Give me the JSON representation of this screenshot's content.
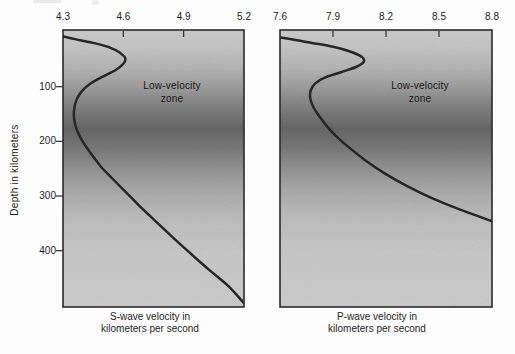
{
  "figure": {
    "colors": {
      "background": "#fdfdfd",
      "curve": "#262626",
      "frame": "#2a2a2a",
      "tick": "#2a2a2a",
      "text": "#1c1c1c",
      "shading_stops": [
        {
          "offset": 0.0,
          "color": "#ececec"
        },
        {
          "offset": 0.07,
          "color": "#e3e3e3"
        },
        {
          "offset": 0.14,
          "color": "#d1d1d1"
        },
        {
          "offset": 0.21,
          "color": "#b5b5b5"
        },
        {
          "offset": 0.28,
          "color": "#959595"
        },
        {
          "offset": 0.355,
          "color": "#777777"
        },
        {
          "offset": 0.43,
          "color": "#8d8d8d"
        },
        {
          "offset": 0.5,
          "color": "#aaaaaa"
        },
        {
          "offset": 0.59,
          "color": "#c8c8c8"
        },
        {
          "offset": 0.68,
          "color": "#dcdcdc"
        },
        {
          "offset": 0.8,
          "color": "#e8e8e8"
        },
        {
          "offset": 1.0,
          "color": "#ececec"
        }
      ]
    }
  },
  "chart_data": [
    {
      "type": "line",
      "ylabel": "Depth in kilometers",
      "xlabel_lines": [
        "S-wave velocity in",
        "kilometers per second"
      ],
      "annotation_lines": [
        "Low-velocity",
        "zone"
      ],
      "xlim": [
        4.3,
        5.2
      ],
      "ylim": [
        0,
        503
      ],
      "x_ticks": [
        4.3,
        4.6,
        4.9,
        5.2
      ],
      "y_ticks": [
        100,
        200,
        300,
        400
      ],
      "grid": false,
      "legend": "none",
      "series": [
        {
          "name": "S-wave velocity",
          "units": "km/s vs depth km",
          "points": [
            [
              4.3,
              8
            ],
            [
              4.36,
              13
            ],
            [
              4.45,
              20
            ],
            [
              4.53,
              28
            ],
            [
              4.58,
              37
            ],
            [
              4.61,
              48
            ],
            [
              4.6,
              58
            ],
            [
              4.56,
              70
            ],
            [
              4.49,
              83
            ],
            [
              4.43,
              96
            ],
            [
              4.39,
              110
            ],
            [
              4.365,
              126
            ],
            [
              4.355,
              143
            ],
            [
              4.355,
              158
            ],
            [
              4.365,
              175
            ],
            [
              4.385,
              192
            ],
            [
              4.415,
              210
            ],
            [
              4.45,
              228
            ],
            [
              4.49,
              247
            ],
            [
              4.545,
              268
            ],
            [
              4.61,
              292
            ],
            [
              4.68,
              318
            ],
            [
              4.76,
              346
            ],
            [
              4.85,
              377
            ],
            [
              4.94,
              407
            ],
            [
              5.03,
              436
            ],
            [
              5.12,
              464
            ],
            [
              5.2,
              496
            ]
          ]
        }
      ]
    },
    {
      "type": "line",
      "ylabel": "Depth in kilometers",
      "xlabel_lines": [
        "P-wave velocity in",
        "kilometers per second"
      ],
      "annotation_lines": [
        "Low-velocity",
        "zone"
      ],
      "xlim": [
        7.6,
        8.8
      ],
      "ylim": [
        0,
        503
      ],
      "x_ticks": [
        7.6,
        7.9,
        8.2,
        8.5,
        8.8
      ],
      "y_ticks": [],
      "grid": false,
      "legend": "none",
      "series": [
        {
          "name": "P-wave velocity",
          "units": "km/s vs depth km",
          "points": [
            [
              7.6,
              10
            ],
            [
              7.68,
              14
            ],
            [
              7.78,
              20
            ],
            [
              7.9,
              27
            ],
            [
              8.0,
              36
            ],
            [
              8.06,
              45
            ],
            [
              8.075,
              54
            ],
            [
              8.03,
              64
            ],
            [
              7.94,
              74
            ],
            [
              7.85,
              84
            ],
            [
              7.8,
              94
            ],
            [
              7.775,
              106
            ],
            [
              7.77,
              118
            ],
            [
              7.78,
              131
            ],
            [
              7.805,
              146
            ],
            [
              7.85,
              166
            ],
            [
              7.91,
              188
            ],
            [
              7.99,
              211
            ],
            [
              8.08,
              234
            ],
            [
              8.19,
              258
            ],
            [
              8.32,
              282
            ],
            [
              8.46,
              304
            ],
            [
              8.62,
              325
            ],
            [
              8.8,
              346
            ]
          ]
        }
      ]
    }
  ]
}
